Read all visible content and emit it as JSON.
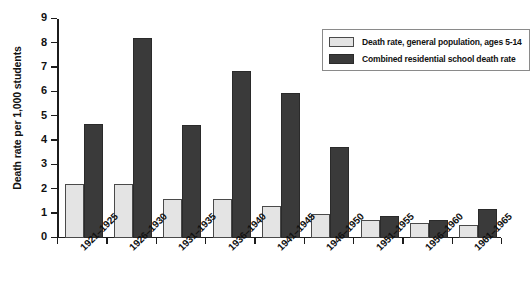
{
  "chart_data": {
    "type": "bar",
    "title": "",
    "xlabel": "",
    "ylabel": "Death rate per 1,000 students",
    "ylim": [
      0,
      9
    ],
    "yticks": [
      0,
      1,
      2,
      3,
      4,
      5,
      6,
      7,
      8,
      9
    ],
    "grid": false,
    "legend_position": "top-right",
    "categories": [
      "1921–1925",
      "1926–1930",
      "1931–1935",
      "1936–1940",
      "1941–1945",
      "1946–1950",
      "1951–1955",
      "1956–1960",
      "1961–1965"
    ],
    "series": [
      {
        "name": "Death rate, general population, ages 5-14",
        "color": "#e4e4e4",
        "values": [
          2.2,
          2.2,
          1.6,
          1.6,
          1.3,
          1.0,
          0.75,
          0.6,
          0.55
        ]
      },
      {
        "name": "Combined residential school death rate",
        "color": "#3a3a3a",
        "values": [
          4.7,
          8.2,
          4.65,
          6.85,
          5.95,
          3.75,
          0.9,
          0.75,
          1.2
        ]
      }
    ]
  },
  "legend": {
    "items": [
      {
        "label": "Death rate, general population, ages 5-14"
      },
      {
        "label": "Combined residential school death rate"
      }
    ]
  }
}
